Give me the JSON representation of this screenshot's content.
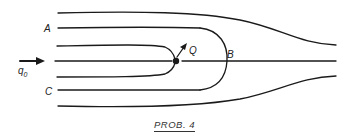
{
  "diagram": {
    "title": "PROB. 4",
    "labels": {
      "A": "A",
      "B": "B",
      "C": "C",
      "Q": "Q",
      "q0_main": "q",
      "q0_sub": "0"
    },
    "elements": [
      "uniform stream arrow q0",
      "source point Q with outward arrow",
      "stagnation point B",
      "dividing streamline (Rankine half-body)",
      "streamlines A and C"
    ],
    "colors": {
      "stroke": "#1a1a1a",
      "background": "#ffffff"
    }
  }
}
